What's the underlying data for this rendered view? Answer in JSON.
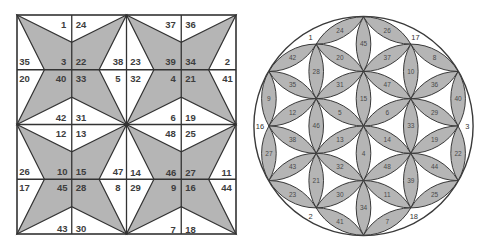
{
  "colors": {
    "background": "#ffffff",
    "shape_fill": "#b5b5b5",
    "stroke": "#333333",
    "text": "#3d3d3d"
  },
  "square_figure": {
    "blocks": [
      {
        "top": [
          "1",
          "24"
        ],
        "upper": [
          "35",
          "3",
          "22",
          "38"
        ],
        "lower": [
          "20",
          "40",
          "33",
          "5"
        ],
        "bottom": [
          "42",
          "31"
        ]
      },
      {
        "top": [
          "37",
          "36"
        ],
        "upper": [
          "23",
          "39",
          "34",
          "2"
        ],
        "lower": [
          "32",
          "4",
          "21",
          "41"
        ],
        "bottom": [
          "6",
          "19"
        ]
      },
      {
        "top": [
          "12",
          "13"
        ],
        "upper": [
          "26",
          "10",
          "15",
          "47"
        ],
        "lower": [
          "17",
          "45",
          "28",
          "8"
        ],
        "bottom": [
          "43",
          "30"
        ]
      },
      {
        "top": [
          "48",
          "25"
        ],
        "upper": [
          "14",
          "46",
          "27",
          "11"
        ],
        "lower": [
          "29",
          "9",
          "16",
          "44"
        ],
        "bottom": [
          "7",
          "18"
        ]
      }
    ]
  },
  "circle_figure": {
    "outer_labels": {
      "top_left": "1",
      "top_right": "17",
      "left": "16",
      "right": "3",
      "bottom_left": "2",
      "bottom_right": "18"
    },
    "petals": [
      {
        "label": "24"
      },
      {
        "label": "26"
      },
      {
        "label": "45"
      },
      {
        "label": "42"
      },
      {
        "label": "28"
      },
      {
        "label": "20"
      },
      {
        "label": "37"
      },
      {
        "label": "10"
      },
      {
        "label": "8"
      },
      {
        "label": "35"
      },
      {
        "label": "31"
      },
      {
        "label": "15"
      },
      {
        "label": "47"
      },
      {
        "label": "36"
      },
      {
        "label": "9"
      },
      {
        "label": "40"
      },
      {
        "label": "12"
      },
      {
        "label": "46"
      },
      {
        "label": "5"
      },
      {
        "label": "6"
      },
      {
        "label": "33"
      },
      {
        "label": "29"
      },
      {
        "label": "38"
      },
      {
        "label": "13"
      },
      {
        "label": "4"
      },
      {
        "label": "14"
      },
      {
        "label": "19"
      },
      {
        "label": "27"
      },
      {
        "label": "22"
      },
      {
        "label": "43"
      },
      {
        "label": "21"
      },
      {
        "label": "32"
      },
      {
        "label": "48"
      },
      {
        "label": "39"
      },
      {
        "label": "44"
      },
      {
        "label": "23"
      },
      {
        "label": "30"
      },
      {
        "label": "11"
      },
      {
        "label": "25"
      },
      {
        "label": "34"
      },
      {
        "label": "41"
      },
      {
        "label": "7"
      }
    ]
  }
}
